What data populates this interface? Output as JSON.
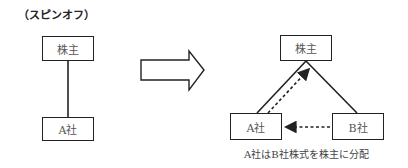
{
  "title": "（スピンオフ）",
  "left_diagram": {
    "top_box": "株主",
    "bottom_box": "A社"
  },
  "transition_arrow": "right-block-arrow",
  "right_diagram": {
    "top_box": "株主",
    "left_box": "A社",
    "right_box": "B社",
    "caption": "A社はB社株式を株主に分配"
  }
}
